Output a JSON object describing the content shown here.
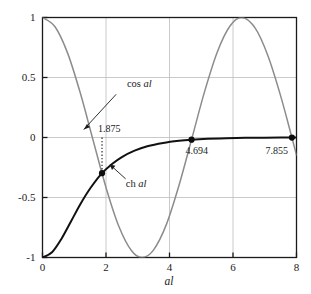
{
  "chart_data": {
    "type": "line",
    "title": "",
    "xlabel": "al",
    "ylabel": "",
    "xlim": [
      0,
      8
    ],
    "ylim": [
      -1,
      1
    ],
    "grid": true,
    "legend": "none",
    "xticks": [
      "0",
      "2",
      "4",
      "6",
      "8"
    ],
    "xtick_values": [
      0,
      2,
      4,
      6,
      8
    ],
    "yticks": [
      "1",
      "0.5",
      "0",
      "-0.5",
      "-1"
    ],
    "ytick_values": [
      1,
      0.5,
      0,
      -0.5,
      -1
    ],
    "series": [
      {
        "name": "cos al",
        "color": "#8c8c8c",
        "formula": "cos(x)",
        "x": [
          0,
          0.4,
          0.8,
          1.2,
          1.5708,
          2.0,
          2.4,
          2.8,
          3.1416,
          3.5,
          3.9,
          4.3,
          4.7124,
          5.1,
          5.5,
          5.9,
          6.2832,
          6.7,
          7.1,
          7.5,
          7.855,
          8.0
        ],
        "values": [
          1.0,
          0.921,
          0.697,
          0.362,
          0.0,
          -0.416,
          -0.737,
          -0.942,
          -1.0,
          -0.936,
          -0.726,
          -0.398,
          0.0,
          0.378,
          0.709,
          0.927,
          1.0,
          0.911,
          0.681,
          0.347,
          0.0,
          -0.146
        ]
      },
      {
        "name": "ch al",
        "color": "#111111",
        "formula": "-1/cosh(x)",
        "x": [
          0,
          0.3,
          0.6,
          0.9,
          1.2,
          1.5,
          1.875,
          2.2,
          2.5,
          2.9,
          3.3,
          3.8,
          4.3,
          4.694,
          5.2,
          5.8,
          6.4,
          7.0,
          7.5,
          7.855,
          8.0
        ],
        "values": [
          -1.0,
          -0.956,
          -0.843,
          -0.698,
          -0.552,
          -0.425,
          -0.297,
          -0.219,
          -0.163,
          -0.11,
          -0.073,
          -0.045,
          -0.027,
          -0.018,
          -0.011,
          -0.006,
          -0.003,
          -0.002,
          -0.001,
          -0.001,
          -0.001
        ]
      }
    ],
    "markers": [
      {
        "name": "intersection-1",
        "x": 1.875,
        "y": -0.297,
        "label": "1.875"
      },
      {
        "name": "intersection-2",
        "x": 4.694,
        "y": -0.018,
        "label": "4.694"
      },
      {
        "name": "intersection-3",
        "x": 7.855,
        "y": -0.001,
        "label": "7.855"
      }
    ],
    "annotations": [
      {
        "name": "cos-curve-label",
        "text_plain": "cos ",
        "text_italic": "al",
        "x": 3.05,
        "y": 0.42
      },
      {
        "name": "ch-curve-label",
        "text_plain": "ch ",
        "text_italic": "al",
        "x": 2.95,
        "y": -0.41
      }
    ],
    "dotted_marker_line": {
      "x": 1.875,
      "y_from": 0.0,
      "y_to": -0.297
    }
  },
  "style": {
    "axis_color": "#1a1a1a",
    "grid_color": "#bdbdbd",
    "background": "#ffffff",
    "cos_color": "#8c8c8c",
    "ch_color": "#111111",
    "marker_color": "#0d0d0d"
  }
}
